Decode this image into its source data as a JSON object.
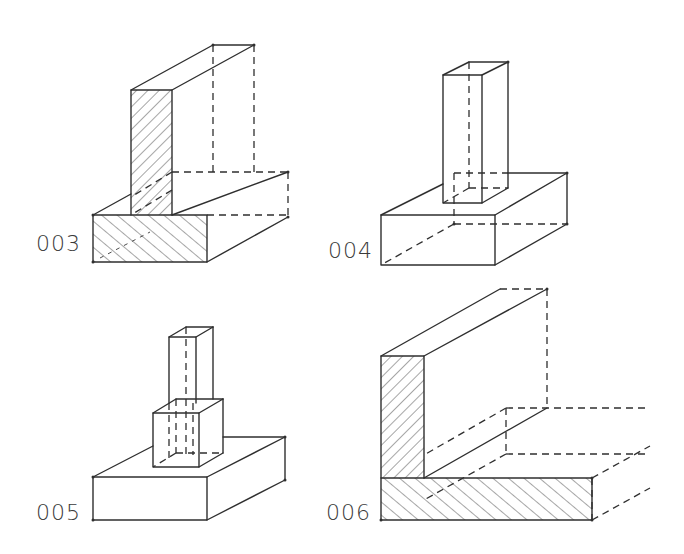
{
  "figures": [
    {
      "id": "fig-003",
      "label": "003",
      "description": "strip footing with wall, hatched section"
    },
    {
      "id": "fig-004",
      "label": "004",
      "description": "pad footing with column"
    },
    {
      "id": "fig-005",
      "label": "005",
      "description": "pad footing with column and pedestal"
    },
    {
      "id": "fig-006",
      "label": "006",
      "description": "corner wall on strip footing, hatched section"
    }
  ],
  "colors": {
    "line": "#2f2f2f",
    "background": "#ffffff",
    "label": "#3a3a3a"
  }
}
